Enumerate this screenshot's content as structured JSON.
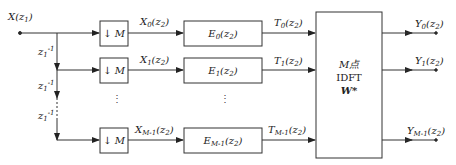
{
  "diagram": {
    "type": "polyphase filter bank block diagram",
    "input": {
      "label": "X",
      "arg": "z",
      "arg_sub": "1"
    },
    "delay": {
      "label": "z",
      "sub": "1",
      "sup": "-1"
    },
    "downsampler": {
      "label": "↓ M"
    },
    "branches": [
      {
        "x_label": "X",
        "x_sub": "0",
        "e_label": "E",
        "e_sub": "0",
        "t_label": "T",
        "t_sub": "0",
        "y_label": "Y",
        "y_sub": "0"
      },
      {
        "x_label": "X",
        "x_sub": "1",
        "e_label": "E",
        "e_sub": "1",
        "t_label": "T",
        "t_sub": "1",
        "y_label": "Y",
        "y_sub": "1"
      },
      {
        "x_label": "X",
        "x_sub": "M-1",
        "e_label": "E",
        "e_sub": "M-1",
        "t_label": "T",
        "t_sub": "M-1",
        "y_label": "Y",
        "y_sub": "M-1"
      }
    ],
    "arg_z2": "(z",
    "arg_z2_sub": "2",
    "arg_close": ")",
    "idft_block": {
      "line1": "M点",
      "line2": "IDFT",
      "line3": "W*"
    },
    "ellipsis": "⋮"
  }
}
